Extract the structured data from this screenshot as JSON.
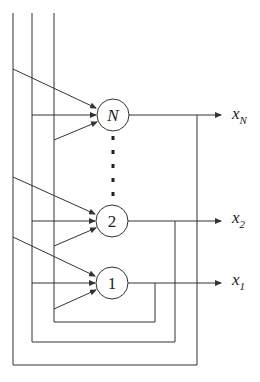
{
  "diagram": {
    "type": "recurrent-network",
    "nodes": [
      {
        "id": "N",
        "label": "N",
        "italic": true,
        "cx": 113,
        "cy": 115,
        "output_label": "x",
        "output_sub": "N"
      },
      {
        "id": "2",
        "label": "2",
        "italic": false,
        "cx": 112,
        "cy": 221,
        "output_label": "x",
        "output_sub": "2"
      },
      {
        "id": "1",
        "label": "1",
        "italic": false,
        "cx": 112,
        "cy": 283,
        "output_label": "x",
        "output_sub": "1"
      }
    ],
    "ellipsis": "vertical dotted line between node N and node 2",
    "colors": {
      "stroke": "#333333",
      "background": "#ffffff"
    }
  }
}
